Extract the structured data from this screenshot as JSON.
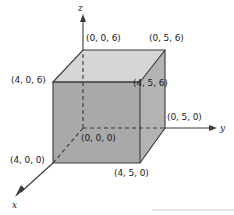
{
  "figure": {
    "type": "3d-coordinate-diagram",
    "background_color": "#ffffff",
    "line_color": "#3a3a3a",
    "text_color": "#1a1a1a",
    "faces": {
      "front_color": "#a9a9a9",
      "right_color": "#b4b4b4",
      "top_color": "#d6d6d6"
    },
    "axes": [
      {
        "name": "x-axis",
        "label": "x",
        "label_x": 12,
        "label_y": 200
      },
      {
        "name": "y-axis",
        "label": "y",
        "label_x": 220,
        "label_y": 123
      },
      {
        "name": "z-axis",
        "label": "z",
        "label_x": 78,
        "label_y": 3
      }
    ],
    "vertices": [
      {
        "name": "vertex-0-0-6",
        "label": "(0, 0, 6)",
        "label_x": 86,
        "label_y": 33,
        "px": 83,
        "py": 50
      },
      {
        "name": "vertex-0-5-6",
        "label": "(0, 5, 6)",
        "label_x": 149,
        "label_y": 33,
        "px": 165,
        "py": 50
      },
      {
        "name": "vertex-4-0-6",
        "label": "(4, 0, 6)",
        "label_x": 11,
        "label_y": 75,
        "px": 53,
        "py": 82
      },
      {
        "name": "vertex-4-5-6",
        "label": "(4, 5, 6)",
        "label_x": 133,
        "label_y": 78,
        "px": 140,
        "py": 82
      },
      {
        "name": "vertex-0-0-0",
        "label": "(0, 0, 0)",
        "label_x": 81,
        "label_y": 133,
        "px": 83,
        "py": 128
      },
      {
        "name": "vertex-0-5-0",
        "label": "(0, 5, 0)",
        "label_x": 167,
        "label_y": 112,
        "px": 165,
        "py": 128
      },
      {
        "name": "vertex-4-0-0",
        "label": "(4, 0, 0)",
        "label_x": 10,
        "label_y": 155,
        "px": 53,
        "py": 163
      },
      {
        "name": "vertex-4-5-0",
        "label": "(4, 5, 0)",
        "label_x": 114,
        "label_y": 168,
        "px": 140,
        "py": 163
      }
    ]
  }
}
